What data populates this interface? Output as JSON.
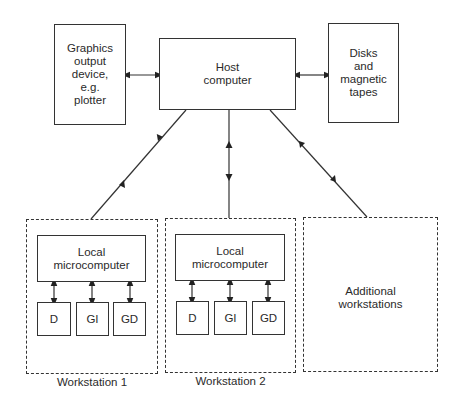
{
  "diagram": {
    "host": {
      "label": "Host\ncomputer"
    },
    "graphics_output": {
      "label": "Graphics\noutput\ndevice,\ne.g.\nplotter"
    },
    "storage": {
      "label": "Disks\nand\nmagnetic\ntapes"
    },
    "workstations": [
      {
        "caption": "Workstation 1",
        "local": "Local\nmicrocomputer",
        "devices": [
          "D",
          "GI",
          "GD"
        ]
      },
      {
        "caption": "Workstation 2",
        "local": "Local\nmicrocomputer",
        "devices": [
          "D",
          "GI",
          "GD"
        ]
      }
    ],
    "additional": {
      "label": "Additional\nworkstations"
    },
    "connections": [
      {
        "from": "graphics_output",
        "to": "host",
        "type": "bidirectional"
      },
      {
        "from": "host",
        "to": "storage",
        "type": "bidirectional"
      },
      {
        "from": "host",
        "to": "workstation_1",
        "type": "bidirectional"
      },
      {
        "from": "host",
        "to": "workstation_2",
        "type": "bidirectional"
      },
      {
        "from": "host",
        "to": "additional",
        "type": "bidirectional"
      },
      {
        "from": "local_microcomputer",
        "to": "D",
        "type": "bidirectional"
      },
      {
        "from": "local_microcomputer",
        "to": "GI",
        "type": "bidirectional"
      },
      {
        "from": "local_microcomputer",
        "to": "GD",
        "type": "bidirectional"
      }
    ]
  }
}
